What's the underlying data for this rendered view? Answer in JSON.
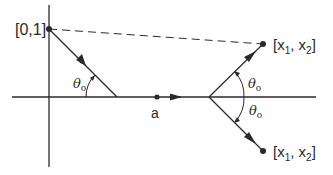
{
  "diagram": {
    "type": "geometric reflection diagram",
    "colors": {
      "ink": "#2a2a2a",
      "background": "#ffffff"
    },
    "points": {
      "source": {
        "label": "[0,1]"
      },
      "a": {
        "label": "a"
      },
      "target_upper": {
        "label": "[x₁, x₂]",
        "label_parts": [
          "[x",
          "1",
          ", x",
          "2",
          "]"
        ]
      },
      "target_lower": {
        "label": "[x₁, x₂]",
        "label_parts": [
          "[x",
          "1",
          ", x",
          "2",
          "]"
        ]
      }
    },
    "angles": {
      "incident": {
        "label": "θ",
        "sub": "o"
      },
      "upper": {
        "label": "θ",
        "sub": "o"
      },
      "lower": {
        "label": "θ",
        "sub": "o"
      }
    }
  }
}
